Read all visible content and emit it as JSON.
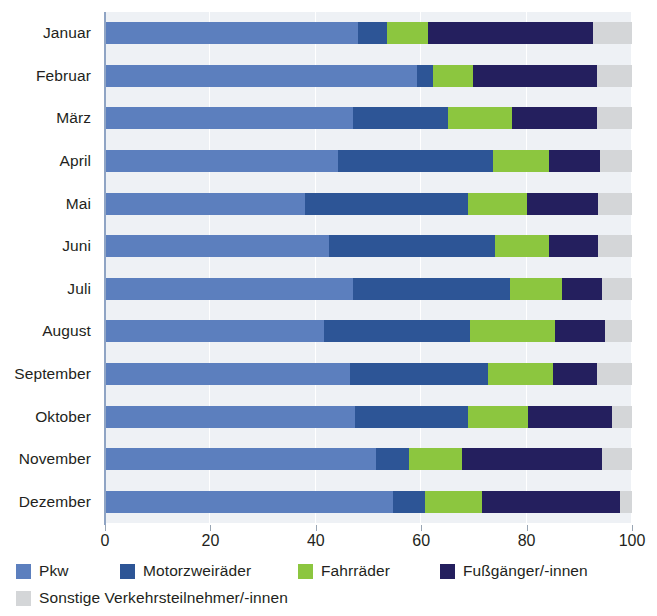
{
  "chart_data": {
    "type": "bar",
    "orientation": "horizontal",
    "stacked": true,
    "title": "",
    "subtitle": "",
    "xlabel": "",
    "ylabel": "",
    "xlim": [
      0,
      100
    ],
    "xticks": [
      0,
      20,
      40,
      60,
      80,
      100
    ],
    "xtick_labels": [
      "0",
      "20",
      "40",
      "60",
      "80",
      "100"
    ],
    "grid": "vertical",
    "legend_position": "bottom-left",
    "categories": [
      "Januar",
      "Februar",
      "März",
      "April",
      "Mai",
      "Juni",
      "Juli",
      "August",
      "September",
      "Oktober",
      "November",
      "Dezember"
    ],
    "series": [
      {
        "name": "Pkw",
        "color": "#5c7fbe",
        "values": [
          48.0,
          59.2,
          47.1,
          44.2,
          38.0,
          42.5,
          47.1,
          41.6,
          46.5,
          47.4,
          51.4,
          54.6
        ]
      },
      {
        "name": "Motorzweiräder",
        "color": "#2d5596",
        "values": [
          5.5,
          3.0,
          18.0,
          29.4,
          30.9,
          31.5,
          29.8,
          27.7,
          26.2,
          21.5,
          6.3,
          6.1
        ]
      },
      {
        "name": "Fahrräder",
        "color": "#8cc63f",
        "values": [
          7.8,
          7.6,
          12.1,
          10.7,
          11.2,
          10.3,
          9.8,
          16.1,
          12.3,
          11.4,
          10.0,
          10.8
        ]
      },
      {
        "name": "Fußgänger/-innen",
        "color": "#241f5e",
        "values": [
          31.3,
          23.6,
          16.2,
          9.7,
          13.4,
          9.2,
          7.6,
          9.5,
          8.4,
          15.9,
          26.6,
          26.2
        ]
      },
      {
        "name": "Sonstige Verkehrsteilnehmer/-innen",
        "color": "#d4d6d8",
        "values": [
          7.4,
          6.6,
          6.6,
          6.0,
          6.5,
          6.5,
          5.7,
          5.1,
          6.6,
          3.8,
          5.7,
          2.3
        ]
      }
    ]
  },
  "legend": {
    "items": [
      {
        "label": "Pkw",
        "color": "#5c7fbe"
      },
      {
        "label": "Motorzweiräder",
        "color": "#2d5596"
      },
      {
        "label": "Fahrräder",
        "color": "#8cc63f"
      },
      {
        "label": "Fußgänger/-innen",
        "color": "#241f5e"
      },
      {
        "label": "Sonstige Verkehrsteilnehmer/-innen",
        "color": "#d4d6d8"
      }
    ]
  },
  "colors": {
    "plot_background": "#eef1f5",
    "gridline": "#ffffff",
    "axis": "#8fa4c4",
    "text": "#231f20"
  }
}
